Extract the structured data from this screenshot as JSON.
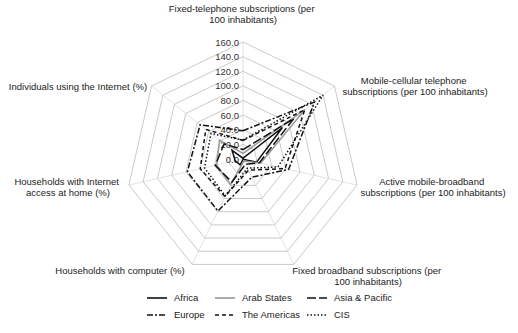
{
  "chart_data": {
    "type": "radar",
    "title": "",
    "axes": [
      {
        "label_lines": [
          "Fixed-telephone subscriptions (per",
          "100 inhabitants)"
        ]
      },
      {
        "label_lines": [
          "Mobile-cellular telephone",
          "subscriptions (per 100 inhabitants)"
        ]
      },
      {
        "label_lines": [
          "Active mobile-broadband",
          "subscriptions (per 100 inhabitants)"
        ]
      },
      {
        "label_lines": [
          "Fixed broadband subscriptions (per",
          "100 inhabitants)"
        ]
      },
      {
        "label_lines": [
          "Households with computer (%)"
        ]
      },
      {
        "label_lines": [
          "Households with Internet",
          "access at home (%)"
        ]
      },
      {
        "label_lines": [
          "Individuals using the Internet (%)"
        ]
      }
    ],
    "categories": [
      "Fixed-telephone subscriptions (per 100 inhabitants)",
      "Mobile-cellular telephone subscriptions (per 100 inhabitants)",
      "Active mobile-broadband subscriptions (per 100 inhabitants)",
      "Fixed broadband subscriptions (per 100 inhabitants)",
      "Households with computer (%)",
      "Households with Internet access at home (%)",
      "Individuals using the Internet (%)"
    ],
    "ticks": [
      "0.0",
      "20.0",
      "40.0",
      "60.0",
      "80.0",
      "100.0",
      "120.0",
      "140.0",
      "160.0"
    ],
    "rmax": 160,
    "grid": true,
    "legend_position": "bottom",
    "series": [
      {
        "name": "Africa",
        "style": "solid",
        "color": "#111111",
        "values": [
          1.1,
          69,
          19,
          0.4,
          9,
          11,
          19
        ]
      },
      {
        "name": "Arab States",
        "style": "solid",
        "color": "#999999",
        "values": [
          7.6,
          108,
          25,
          3,
          39,
          37,
          41
        ]
      },
      {
        "name": "Asia & Pacific",
        "style": "longdash",
        "color": "#111111",
        "values": [
          12.9,
          89,
          23,
          8,
          35,
          39,
          33
        ]
      },
      {
        "name": "Europe",
        "style": "dashdot",
        "color": "#111111",
        "values": [
          38.6,
          125,
          64,
          27.7,
          79,
          78,
          75
        ]
      },
      {
        "name": "The Americas",
        "style": "dash",
        "color": "#111111",
        "values": [
          25.4,
          108,
          59,
          17,
          57,
          60,
          65
        ]
      },
      {
        "name": "CIS",
        "style": "dot",
        "color": "#111111",
        "values": [
          25.9,
          140,
          49,
          14,
          56,
          54,
          56
        ]
      }
    ]
  },
  "legend": {
    "items": [
      "Africa",
      "Arab States",
      "Asia & Pacific",
      "Europe",
      "The Americas",
      "CIS"
    ]
  }
}
